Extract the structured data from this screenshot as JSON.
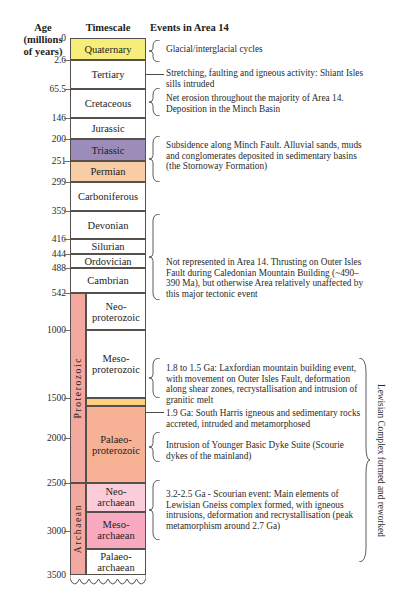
{
  "headers": {
    "age": "Age\n(millions\nof years)",
    "age_line1": "Age",
    "age_line2": "(millions",
    "age_line3": "of years)",
    "timescale": "Timescale",
    "events": "Events in Area 14"
  },
  "axis": {
    "unit": "millions of years",
    "labels": [
      "0",
      "2.6",
      "65.5",
      "146",
      "200",
      "251",
      "299",
      "359",
      "416",
      "444",
      "488",
      "542",
      "1000",
      "1500",
      "2000",
      "2500",
      "3000",
      "3500"
    ],
    "values": [
      0,
      2.6,
      65.5,
      146,
      200,
      251,
      299,
      359,
      416,
      444,
      488,
      542,
      1000,
      1500,
      2000,
      2500,
      3000,
      3500
    ]
  },
  "eons": [
    {
      "name": "Proterozoic",
      "start_ma": 542,
      "end_ma": 2500,
      "color": "#f4a9a0"
    },
    {
      "name": "Archaean",
      "start_ma": 2500,
      "end_ma": 3500,
      "color": "#f4a9a0"
    }
  ],
  "periods": [
    {
      "name": "Quaternary",
      "top_ma": 0,
      "base_ma": 2.6,
      "color": "#f5ee7a",
      "indent": false
    },
    {
      "name": "Tertiary",
      "top_ma": 2.6,
      "base_ma": 65.5,
      "color": "#ffffff",
      "indent": false
    },
    {
      "name": "Cretaceous",
      "top_ma": 65.5,
      "base_ma": 146,
      "color": "#ffffff",
      "indent": false
    },
    {
      "name": "Jurassic",
      "top_ma": 146,
      "base_ma": 200,
      "color": "#ffffff",
      "indent": false
    },
    {
      "name": "Triassic",
      "top_ma": 200,
      "base_ma": 251,
      "color": "#9b8cba",
      "indent": false
    },
    {
      "name": "Permian",
      "top_ma": 251,
      "base_ma": 299,
      "color": "#f8cda6",
      "indent": false
    },
    {
      "name": "Carboniferous",
      "top_ma": 299,
      "base_ma": 359,
      "color": "#ffffff",
      "indent": false
    },
    {
      "name": "Devonian",
      "top_ma": 359,
      "base_ma": 416,
      "color": "#ffffff",
      "indent": false
    },
    {
      "name": "Silurian",
      "top_ma": 416,
      "base_ma": 444,
      "color": "#ffffff",
      "indent": false
    },
    {
      "name": "Ordovician",
      "top_ma": 444,
      "base_ma": 488,
      "color": "#ffffff",
      "indent": false
    },
    {
      "name": "Cambrian",
      "top_ma": 488,
      "base_ma": 542,
      "color": "#ffffff",
      "indent": false
    },
    {
      "name": "Neo-\nproterozoic",
      "top_ma": 542,
      "base_ma": 1000,
      "color": "#ffffff",
      "indent": true
    },
    {
      "name": "Meso-\nproterozoic",
      "top_ma": 1000,
      "base_ma": 1500,
      "color": "#ffffff",
      "indent": true
    },
    {
      "name": "",
      "top_ma": 1500,
      "base_ma": 1600,
      "color": "#fcd080",
      "indent": true
    },
    {
      "name": "Palaeo-\nproterozoic",
      "top_ma": 1600,
      "base_ma": 2500,
      "color": "#f7b195",
      "indent": true
    },
    {
      "name": "Neo-\narchaean",
      "top_ma": 2500,
      "base_ma": 2800,
      "color": "#fbcdd9",
      "indent": true
    },
    {
      "name": "Meso-\narchaean",
      "top_ma": 2800,
      "base_ma": 3200,
      "color": "#f9a9c0",
      "indent": true
    },
    {
      "name": "Palaeo-\narchaean",
      "top_ma": 3200,
      "base_ma": 3500,
      "color": "#ffffff",
      "indent": true
    }
  ],
  "events": [
    {
      "id": "glacial",
      "text": "Glacial/interglacial cycles"
    },
    {
      "id": "shiant",
      "text": "Stretching, faulting and igneous activity: Shiant Isles sills intruded"
    },
    {
      "id": "minch",
      "text": "Net erosion throughout the majority of Area 14. Deposition in the Minch Basin"
    },
    {
      "id": "stornoway",
      "text": "Subsidence along Minch Fault. Alluvial sands, muds and conglomerates deposited in sedimentary basins (the Stornoway Formation)"
    },
    {
      "id": "caledonian",
      "text": "Not represented in Area 14. Thrusting on Outer Isles Fault during Caledonian Mountain Building (~490–390 Ma), but otherwise Area relatively unaffected by this major tectonic event"
    },
    {
      "id": "laxfordian",
      "text": "1.8 to 1.5 Ga: Laxfordian mountain building event, with movement on Outer Isles Fault, deformation along shear zones, recrystallisation and intrusion of granitic melt"
    },
    {
      "id": "southharris",
      "text": "1.9 Ga: South Harris igneous and sedimentary rocks accreted, intruded and metamorphosed"
    },
    {
      "id": "scourie",
      "text": "Intrusion of Younger Basic Dyke Suite (Scourie dykes of the mainland)"
    },
    {
      "id": "scourian",
      "text": "3.2-2.5 Ga - Scourian event: Main elements of Lewisian Gneiss complex formed, with igneous intrusions, deformation and recrystallisation (peak metamorphism around 2.7 Ga)"
    }
  ],
  "right_annotation": {
    "text": "Lewisian Complex formed and reworked"
  },
  "colors": {
    "quaternary": "#f5ee7a",
    "triassic": "#9b8cba",
    "permian": "#f8cda6",
    "palaeoproterozoic": "#f7b195",
    "laxfordian_band": "#fcd080",
    "neoarchaean": "#fbcdd9",
    "mesoarchaean": "#f9a9c0",
    "eon_spine": "#f4a9a0",
    "border": "#55504c",
    "text": "#2b2b2b"
  }
}
